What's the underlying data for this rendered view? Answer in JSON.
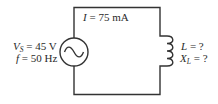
{
  "diagram": {
    "type": "ac-series-circuit",
    "current": {
      "symbol": "I",
      "value": "75 mA",
      "label": "I = 75 mA"
    },
    "source": {
      "kind": "ac-voltage-source",
      "icon": "sine-wave-icon",
      "voltage": {
        "symbol": "V",
        "subscript": "S",
        "value": "45 V"
      },
      "frequency": {
        "symbol": "f",
        "value": "50 Hz"
      }
    },
    "inductor": {
      "kind": "inductor",
      "icon": "coil-icon",
      "inductance": {
        "symbol": "L",
        "value": "?"
      },
      "reactance": {
        "symbol": "X",
        "subscript": "L",
        "value": "?"
      }
    },
    "colors": {
      "wire": "#333333",
      "text": "#2a2a2a",
      "background": "#ffffff"
    }
  }
}
